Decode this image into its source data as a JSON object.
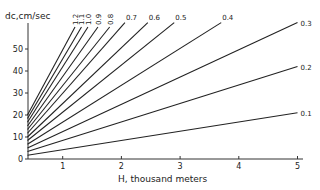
{
  "chart_data": {
    "type": "line",
    "title": "",
    "ylabel": "dc, cm/sec",
    "xlabel": "H, thousand meters",
    "xlim": [
      0.4,
      5.1
    ],
    "ylim": [
      0,
      62
    ],
    "xticks": [
      1,
      2,
      3,
      4,
      5
    ],
    "yticks": [
      0,
      10,
      20,
      30,
      40,
      50
    ],
    "grid": false,
    "legend": "inline labels at line ends",
    "series": [
      {
        "name": "0.1",
        "points": [
          [
            0.4,
            1.7
          ],
          [
            5.0,
            21
          ]
        ]
      },
      {
        "name": "0.2",
        "points": [
          [
            0.4,
            3.4
          ],
          [
            5.0,
            42
          ]
        ]
      },
      {
        "name": "0.3",
        "points": [
          [
            0.4,
            5.0
          ],
          [
            5.0,
            62
          ]
        ]
      },
      {
        "name": "0.4",
        "points": [
          [
            0.4,
            6.7
          ],
          [
            3.7,
            62
          ]
        ]
      },
      {
        "name": "0.5",
        "points": [
          [
            0.4,
            8.4
          ],
          [
            2.9,
            62
          ]
        ]
      },
      {
        "name": "0.6",
        "points": [
          [
            0.4,
            10.0
          ],
          [
            2.45,
            62
          ]
        ]
      },
      {
        "name": "0.7",
        "points": [
          [
            0.4,
            11.7
          ],
          [
            2.06,
            62
          ]
        ]
      },
      {
        "name": "0.8",
        "points": [
          [
            0.4,
            13.4
          ],
          [
            1.8,
            60
          ]
        ]
      },
      {
        "name": "0.9",
        "points": [
          [
            0.4,
            15.0
          ],
          [
            1.6,
            60
          ]
        ]
      },
      {
        "name": "1.0",
        "points": [
          [
            0.4,
            16.7
          ],
          [
            1.43,
            60
          ]
        ]
      },
      {
        "name": "1.1",
        "points": [
          [
            0.4,
            18.4
          ],
          [
            1.32,
            60
          ]
        ]
      },
      {
        "name": "1.2",
        "points": [
          [
            0.4,
            20.0
          ],
          [
            1.21,
            60
          ]
        ]
      }
    ]
  },
  "labels": {
    "ylabel": "dc,cm/sec",
    "xlabel": "H, thousand meters"
  }
}
